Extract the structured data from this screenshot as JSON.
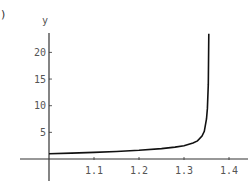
{
  "corner_label": ")",
  "chart_data": {
    "type": "line",
    "title": "",
    "xlabel": "",
    "ylabel": "y",
    "xlim": [
      1.0,
      1.42
    ],
    "ylim": [
      -3,
      24
    ],
    "x_ticks": [
      1.1,
      1.2,
      1.3,
      1.4
    ],
    "x_tick_labels": [
      "1.1",
      "1.2",
      "1.3",
      "1.4"
    ],
    "y_ticks": [
      5,
      10,
      15,
      20
    ],
    "y_tick_labels": [
      "5",
      "10",
      "15",
      "20"
    ],
    "grid": false,
    "legend": null,
    "series": [
      {
        "name": "y",
        "x": [
          1.0,
          1.05,
          1.1,
          1.15,
          1.2,
          1.25,
          1.28,
          1.3,
          1.32,
          1.33,
          1.34,
          1.345,
          1.35,
          1.352,
          1.354,
          1.355
        ],
        "y": [
          1.0,
          1.11,
          1.24,
          1.41,
          1.63,
          1.95,
          2.23,
          2.5,
          3.0,
          3.4,
          4.3,
          5.2,
          7.5,
          9.5,
          14.0,
          23.5
        ]
      }
    ],
    "asymptote_x": 1.356
  }
}
